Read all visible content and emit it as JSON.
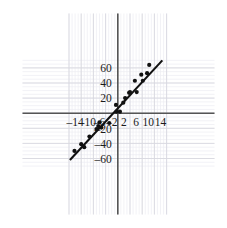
{
  "chart_data": {
    "type": "scatter",
    "title": "",
    "subtitle": "",
    "xlabel": "",
    "ylabel": "",
    "xlim": [
      -16,
      16
    ],
    "ylim": [
      -72,
      72
    ],
    "xticks": [
      -14,
      -10,
      -6,
      -2,
      2,
      6,
      10,
      14
    ],
    "yticks": [
      60,
      40,
      20,
      -20,
      -40,
      -60
    ],
    "xtick_labels": [
      "–14",
      "–10",
      "–6",
      "–2",
      "2",
      "6",
      "10",
      "14"
    ],
    "ytick_labels": [
      "60",
      "40",
      "20",
      "–20",
      "–40",
      "–60"
    ],
    "grid": true,
    "grid_major_step_x": 4,
    "grid_major_step_y": 20,
    "grid_minor_step_x": 1,
    "grid_minor_step_y": 5,
    "legend": "none",
    "axis_color": "#555555",
    "grid_major_color": "#d8d8e0",
    "grid_minor_color": "#ededf2",
    "marker_color": "#111111",
    "line_color": "#111111",
    "series": [
      {
        "name": "data points",
        "type": "scatter",
        "points": [
          [
            -14.2,
            -50.0
          ],
          [
            -12.0,
            -41.0
          ],
          [
            -11.0,
            -45.0
          ],
          [
            -9.3,
            -31.0
          ],
          [
            -7.0,
            -21.0
          ],
          [
            -6.4,
            -17.0
          ],
          [
            -6.0,
            -12.0
          ],
          [
            -5.4,
            -19.0
          ],
          [
            -2.8,
            -13.0
          ],
          [
            -0.6,
            11.0
          ],
          [
            -0.4,
            2.0
          ],
          [
            0.7,
            2.0
          ],
          [
            1.8,
            14.0
          ],
          [
            2.4,
            20.0
          ],
          [
            3.7,
            27.0
          ],
          [
            4.0,
            28.0
          ],
          [
            5.6,
            43.0
          ],
          [
            6.2,
            28.0
          ],
          [
            7.7,
            51.0
          ],
          [
            8.2,
            43.0
          ],
          [
            9.6,
            53.0
          ],
          [
            10.3,
            64.0
          ]
        ]
      },
      {
        "name": "regression line",
        "type": "line",
        "slope": 6.6,
        "intercept": 0,
        "x_start": -15.7,
        "x_end": 14.6,
        "y_start": -62.0,
        "y_end": 70.0
      }
    ]
  }
}
